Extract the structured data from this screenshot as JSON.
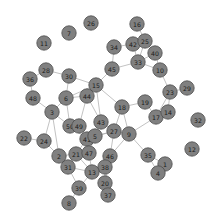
{
  "figure": {
    "title": "",
    "background_color": "#ffffff",
    "node_fill_color": "#808080",
    "node_stroke_color": "#4d4d4d",
    "edge_color": "#a8a8a8",
    "label_color": "#1a1a1a",
    "node_radius": 7.2,
    "width": 218,
    "height": 223
  },
  "chart_data": {
    "type": "scatter",
    "title": "",
    "xlabel": "",
    "ylabel": "",
    "grid": false,
    "legend": "none",
    "xlim": [
      0,
      218
    ],
    "ylim": [
      0,
      223
    ],
    "graph_kind": "undirected-node-link",
    "node_count": 50,
    "edge_count": 75,
    "nodes": [
      {
        "id": "11",
        "label": "11",
        "x": 44,
        "y": 43
      },
      {
        "id": "7",
        "label": "7",
        "x": 69,
        "y": 33
      },
      {
        "id": "26",
        "label": "26",
        "x": 91,
        "y": 23
      },
      {
        "id": "16",
        "label": "16",
        "x": 137,
        "y": 24
      },
      {
        "id": "34",
        "label": "34",
        "x": 114,
        "y": 47
      },
      {
        "id": "42",
        "label": "42",
        "x": 133,
        "y": 44
      },
      {
        "id": "25",
        "label": "25",
        "x": 145,
        "y": 41
      },
      {
        "id": "40",
        "label": "40",
        "x": 155,
        "y": 53
      },
      {
        "id": "33",
        "label": "33",
        "x": 138,
        "y": 62
      },
      {
        "id": "45",
        "label": "45",
        "x": 112,
        "y": 69
      },
      {
        "id": "10",
        "label": "10",
        "x": 160,
        "y": 70
      },
      {
        "id": "23",
        "label": "23",
        "x": 170,
        "y": 92
      },
      {
        "id": "29",
        "label": "29",
        "x": 187,
        "y": 88
      },
      {
        "id": "28",
        "label": "28",
        "x": 46,
        "y": 70
      },
      {
        "id": "36",
        "label": "36",
        "x": 30,
        "y": 79
      },
      {
        "id": "30",
        "label": "30",
        "x": 69,
        "y": 76
      },
      {
        "id": "15",
        "label": "15",
        "x": 96,
        "y": 85
      },
      {
        "id": "48",
        "label": "48",
        "x": 33,
        "y": 98
      },
      {
        "id": "6",
        "label": "6",
        "x": 66,
        "y": 98
      },
      {
        "id": "44",
        "label": "44",
        "x": 87,
        "y": 96
      },
      {
        "id": "18",
        "label": "18",
        "x": 122,
        "y": 107
      },
      {
        "id": "19",
        "label": "19",
        "x": 145,
        "y": 102
      },
      {
        "id": "3",
        "label": "3",
        "x": 52,
        "y": 112
      },
      {
        "id": "17",
        "label": "17",
        "x": 156,
        "y": 117
      },
      {
        "id": "14",
        "label": "14",
        "x": 168,
        "y": 112
      },
      {
        "id": "32",
        "label": "32",
        "x": 198,
        "y": 120
      },
      {
        "id": "43",
        "label": "43",
        "x": 101,
        "y": 122
      },
      {
        "id": "50",
        "label": "50",
        "x": 70,
        "y": 126
      },
      {
        "id": "49",
        "label": "49",
        "x": 79,
        "y": 126
      },
      {
        "id": "27",
        "label": "27",
        "x": 114,
        "y": 131
      },
      {
        "id": "9",
        "label": "9",
        "x": 129,
        "y": 134
      },
      {
        "id": "22",
        "label": "22",
        "x": 24,
        "y": 138
      },
      {
        "id": "24",
        "label": "24",
        "x": 44,
        "y": 141
      },
      {
        "id": "41",
        "label": "41",
        "x": 87,
        "y": 139
      },
      {
        "id": "5",
        "label": "5",
        "x": 95,
        "y": 136
      },
      {
        "id": "12",
        "label": "12",
        "x": 192,
        "y": 149
      },
      {
        "id": "35",
        "label": "35",
        "x": 148,
        "y": 155
      },
      {
        "id": "21",
        "label": "21",
        "x": 76,
        "y": 154
      },
      {
        "id": "47",
        "label": "47",
        "x": 89,
        "y": 153
      },
      {
        "id": "2",
        "label": "2",
        "x": 59,
        "y": 156
      },
      {
        "id": "46",
        "label": "46",
        "x": 110,
        "y": 156
      },
      {
        "id": "1",
        "label": "1",
        "x": 165,
        "y": 164
      },
      {
        "id": "31",
        "label": "31",
        "x": 68,
        "y": 167
      },
      {
        "id": "38",
        "label": "38",
        "x": 105,
        "y": 167
      },
      {
        "id": "13",
        "label": "13",
        "x": 92,
        "y": 172
      },
      {
        "id": "4",
        "label": "4",
        "x": 158,
        "y": 173
      },
      {
        "id": "20",
        "label": "20",
        "x": 105,
        "y": 183
      },
      {
        "id": "39",
        "label": "39",
        "x": 79,
        "y": 188
      },
      {
        "id": "37",
        "label": "37",
        "x": 108,
        "y": 195
      },
      {
        "id": "8",
        "label": "8",
        "x": 69,
        "y": 203
      }
    ],
    "edges": [
      [
        "16",
        "25"
      ],
      [
        "34",
        "42"
      ],
      [
        "42",
        "25"
      ],
      [
        "42",
        "33"
      ],
      [
        "25",
        "33"
      ],
      [
        "25",
        "40"
      ],
      [
        "40",
        "10"
      ],
      [
        "33",
        "40"
      ],
      [
        "33",
        "10"
      ],
      [
        "34",
        "45"
      ],
      [
        "45",
        "33"
      ],
      [
        "45",
        "15"
      ],
      [
        "10",
        "23"
      ],
      [
        "23",
        "29"
      ],
      [
        "23",
        "14"
      ],
      [
        "23",
        "17"
      ],
      [
        "28",
        "36"
      ],
      [
        "28",
        "30"
      ],
      [
        "36",
        "48"
      ],
      [
        "48",
        "3"
      ],
      [
        "30",
        "6"
      ],
      [
        "30",
        "15"
      ],
      [
        "15",
        "44"
      ],
      [
        "15",
        "6"
      ],
      [
        "15",
        "18"
      ],
      [
        "15",
        "43"
      ],
      [
        "44",
        "6"
      ],
      [
        "44",
        "43"
      ],
      [
        "44",
        "49"
      ],
      [
        "6",
        "3"
      ],
      [
        "6",
        "50"
      ],
      [
        "3",
        "24"
      ],
      [
        "3",
        "50"
      ],
      [
        "3",
        "2"
      ],
      [
        "18",
        "19"
      ],
      [
        "18",
        "27"
      ],
      [
        "18",
        "9"
      ],
      [
        "19",
        "17"
      ],
      [
        "17",
        "14"
      ],
      [
        "17",
        "9"
      ],
      [
        "43",
        "27"
      ],
      [
        "43",
        "5"
      ],
      [
        "50",
        "49"
      ],
      [
        "50",
        "41"
      ],
      [
        "49",
        "41"
      ],
      [
        "27",
        "9"
      ],
      [
        "27",
        "5"
      ],
      [
        "27",
        "46"
      ],
      [
        "27",
        "41"
      ],
      [
        "9",
        "35"
      ],
      [
        "9",
        "46"
      ],
      [
        "22",
        "24"
      ],
      [
        "24",
        "2"
      ],
      [
        "41",
        "5"
      ],
      [
        "41",
        "21"
      ],
      [
        "41",
        "47"
      ],
      [
        "5",
        "47"
      ],
      [
        "35",
        "1"
      ],
      [
        "35",
        "4"
      ],
      [
        "1",
        "4"
      ],
      [
        "21",
        "47"
      ],
      [
        "21",
        "2"
      ],
      [
        "21",
        "31"
      ],
      [
        "21",
        "13"
      ],
      [
        "2",
        "31"
      ],
      [
        "47",
        "13"
      ],
      [
        "46",
        "38"
      ],
      [
        "46",
        "20"
      ],
      [
        "38",
        "13"
      ],
      [
        "38",
        "20"
      ],
      [
        "13",
        "31"
      ],
      [
        "13",
        "39"
      ],
      [
        "31",
        "39"
      ],
      [
        "39",
        "8"
      ],
      [
        "20",
        "37"
      ]
    ]
  }
}
